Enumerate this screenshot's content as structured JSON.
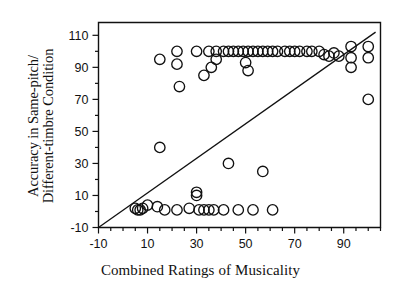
{
  "chart_data": {
    "type": "scatter",
    "title": "",
    "xlabel": "Combined Ratings of Musicality",
    "ylabel_line1": "Accuracy in Same-pitch/",
    "ylabel_line2": "Different-timbre Condition",
    "xlim": [
      -10,
      105
    ],
    "ylim": [
      -10,
      118
    ],
    "xticks": [
      -10,
      10,
      30,
      50,
      70,
      90
    ],
    "yticks": [
      -10,
      10,
      30,
      50,
      70,
      90,
      110
    ],
    "xminor_step": 5,
    "yminor_step": 10,
    "grid": false,
    "legend": null,
    "marker": "open-circle",
    "marker_color": "#111111",
    "points": [
      [
        15,
        95
      ],
      [
        22,
        100
      ],
      [
        22,
        92
      ],
      [
        30,
        100
      ],
      [
        35,
        100
      ],
      [
        38,
        100
      ],
      [
        38,
        95
      ],
      [
        41,
        100
      ],
      [
        43,
        100
      ],
      [
        45,
        100
      ],
      [
        47,
        100
      ],
      [
        49,
        100
      ],
      [
        51,
        100
      ],
      [
        53,
        100
      ],
      [
        55,
        100
      ],
      [
        57,
        100
      ],
      [
        59,
        100
      ],
      [
        61,
        100
      ],
      [
        63,
        100
      ],
      [
        66,
        100
      ],
      [
        68,
        100
      ],
      [
        70,
        100
      ],
      [
        72,
        100
      ],
      [
        75,
        100
      ],
      [
        77,
        100
      ],
      [
        80,
        100
      ],
      [
        82,
        98
      ],
      [
        84,
        97
      ],
      [
        86,
        99
      ],
      [
        88,
        97
      ],
      [
        93,
        103
      ],
      [
        93,
        96
      ],
      [
        93,
        90
      ],
      [
        100,
        103
      ],
      [
        100,
        96
      ],
      [
        100,
        70
      ],
      [
        36,
        90
      ],
      [
        50,
        93
      ],
      [
        51,
        88
      ],
      [
        33,
        85
      ],
      [
        23,
        78
      ],
      [
        15,
        40
      ],
      [
        43,
        30
      ],
      [
        57,
        25
      ],
      [
        30,
        12
      ],
      [
        30,
        10
      ],
      [
        5,
        2
      ],
      [
        6,
        1
      ],
      [
        7,
        1
      ],
      [
        8,
        2
      ],
      [
        10,
        4
      ],
      [
        14,
        3
      ],
      [
        17,
        1
      ],
      [
        22,
        1
      ],
      [
        27,
        2
      ],
      [
        31,
        1
      ],
      [
        33,
        1
      ],
      [
        35,
        1
      ],
      [
        37,
        1
      ],
      [
        41,
        1
      ],
      [
        47,
        1
      ],
      [
        53,
        1
      ],
      [
        61,
        1
      ]
    ],
    "regression_line": {
      "x0": -10,
      "y0": -10,
      "x1": 103,
      "y1": 112
    }
  },
  "axes": {
    "frame_color": "#111111",
    "frame_width": 1.4
  }
}
